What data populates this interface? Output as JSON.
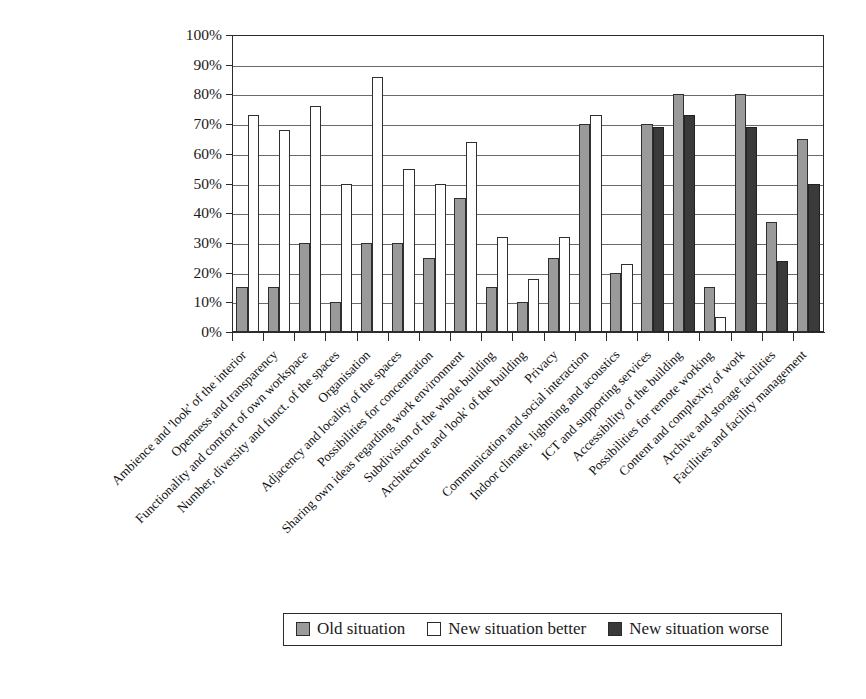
{
  "chart_data": {
    "type": "bar",
    "title": "",
    "xlabel": "",
    "ylabel": "",
    "ylim": [
      0,
      100
    ],
    "ytick_labels": [
      "0%",
      "10%",
      "20%",
      "30%",
      "40%",
      "50%",
      "60%",
      "70%",
      "80%",
      "90%",
      "100%"
    ],
    "ytick_values": [
      0,
      10,
      20,
      30,
      40,
      50,
      60,
      70,
      80,
      90,
      100
    ],
    "grid": true,
    "legend_position": "bottom-center",
    "categories": [
      "Ambience and 'look' of the interior",
      "Openness and transparency",
      "Functionality and comfort of own workspace",
      "Number, diversity and funct. of the spaces",
      "Organisation",
      "Adjacency and locality of the spaces",
      "Possibilities for concentration",
      "Sharing own ideas regarding work environment",
      "Subdivision of the whole building",
      "Architecture and 'look' of the building",
      "Privacy",
      "Communication and social interaction",
      "Indoor climate, lightning and acoustics",
      "ICT and supporting services",
      "Accessibility of the building",
      "Possibilities for remote working",
      "Content and complexity of work",
      "Archive and storage facilities",
      "Facilities and facility management"
    ],
    "series": [
      {
        "name": "Old situation",
        "color": "#9a9a9a",
        "values": [
          15,
          15,
          30,
          10,
          30,
          30,
          25,
          45,
          15,
          10,
          25,
          70,
          20,
          70,
          80,
          15,
          80,
          37,
          65
        ]
      },
      {
        "name": "New situation better",
        "color": "#ffffff",
        "values": [
          73,
          68,
          76,
          50,
          86,
          55,
          50,
          64,
          32,
          18,
          32,
          73,
          23,
          null,
          null,
          5,
          null,
          null,
          null
        ]
      },
      {
        "name": "New situation worse",
        "color": "#3a3a3a",
        "values": [
          null,
          null,
          null,
          null,
          null,
          null,
          null,
          null,
          null,
          null,
          null,
          null,
          null,
          69,
          73,
          null,
          69,
          24,
          50
        ]
      }
    ]
  },
  "legend": {
    "items": [
      {
        "label": "Old situation",
        "swatch": "old"
      },
      {
        "label": "New situation better",
        "swatch": "better"
      },
      {
        "label": "New situation worse",
        "swatch": "worse"
      }
    ]
  },
  "caption": {
    "text": ""
  }
}
